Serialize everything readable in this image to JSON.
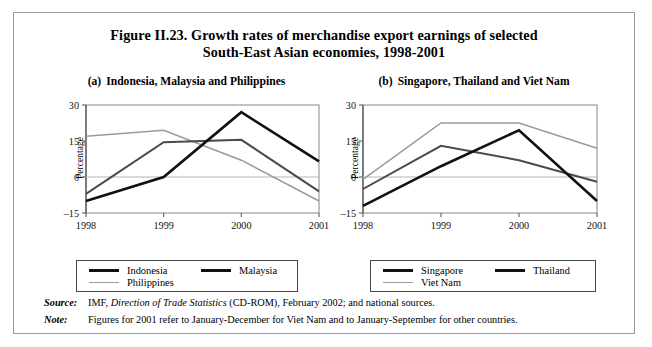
{
  "figure": {
    "title_line1": "Figure II.23.  Growth rates of merchandise export earnings of selected",
    "title_line2": "South-East Asian economies, 1998-2001"
  },
  "panels": [
    {
      "id": "a",
      "label": "(a)",
      "caption": "Indonesia, Malaysia and Philippines",
      "ylabel": "Percentage",
      "legend": [
        {
          "name": "Indonesia",
          "color": "#111111",
          "width": 2.6
        },
        {
          "name": "Malaysia",
          "color": "#111111",
          "width": 2.6
        },
        {
          "name": "Philippines",
          "color": "#9a9a9a",
          "width": 1.5
        }
      ]
    },
    {
      "id": "b",
      "label": "(b)",
      "caption": "Singapore, Thailand and Viet Nam",
      "ylabel": "Percentage",
      "legend": [
        {
          "name": "Singapore",
          "color": "#111111",
          "width": 2.6
        },
        {
          "name": "Thailand",
          "color": "#111111",
          "width": 2.6
        },
        {
          "name": "Viet Nam",
          "color": "#9a9a9a",
          "width": 1.5
        }
      ]
    }
  ],
  "footnotes": [
    {
      "key": "Source:",
      "text_parts": [
        {
          "text": "IMF, ",
          "italic": false
        },
        {
          "text": "Direction of Trade Statistics",
          "italic": true
        },
        {
          "text": " (CD-ROM), February 2002; and national sources.",
          "italic": false
        }
      ]
    },
    {
      "key": "Note:",
      "text_parts": [
        {
          "text": "Figures for 2001 refer to January-December for Viet Nam and to January-September for other countries.",
          "italic": false
        }
      ]
    }
  ],
  "chart_data": [
    {
      "type": "line",
      "panel": "a",
      "title": "(a)  Indonesia, Malaysia and Philippines",
      "xlabel": "",
      "ylabel": "Percentage",
      "x": [
        "1998",
        "1999",
        "2000",
        "2001"
      ],
      "yticks": [
        -15,
        0,
        15,
        30
      ],
      "ylim": [
        -15,
        30
      ],
      "grid": false,
      "legend_position": "bottom",
      "series": [
        {
          "name": "Indonesia",
          "values": [
            -10,
            0,
            27,
            6.5
          ],
          "color": "#111111",
          "width": 2.6
        },
        {
          "name": "Malaysia",
          "values": [
            -7,
            14.5,
            15.5,
            -6
          ],
          "color": "#4a4a4a",
          "width": 2.0
        },
        {
          "name": "Philippines",
          "values": [
            17,
            19.5,
            7,
            -10
          ],
          "color": "#9a9a9a",
          "width": 1.5
        }
      ]
    },
    {
      "type": "line",
      "panel": "b",
      "title": "(b)  Singapore, Thailand and Viet Nam",
      "xlabel": "",
      "ylabel": "Percentage",
      "x": [
        "1998",
        "1999",
        "2000",
        "2001"
      ],
      "yticks": [
        -15,
        0,
        15,
        30
      ],
      "ylim": [
        -15,
        30
      ],
      "grid": false,
      "legend_position": "bottom",
      "series": [
        {
          "name": "Singapore",
          "values": [
            -12,
            4.5,
            19.5,
            -10
          ],
          "color": "#111111",
          "width": 2.6
        },
        {
          "name": "Thailand",
          "values": [
            -5,
            13,
            7,
            -2
          ],
          "color": "#4a4a4a",
          "width": 2.0
        },
        {
          "name": "Viet Nam",
          "values": [
            -1,
            22.5,
            22.5,
            12
          ],
          "color": "#9a9a9a",
          "width": 1.5
        }
      ]
    }
  ]
}
